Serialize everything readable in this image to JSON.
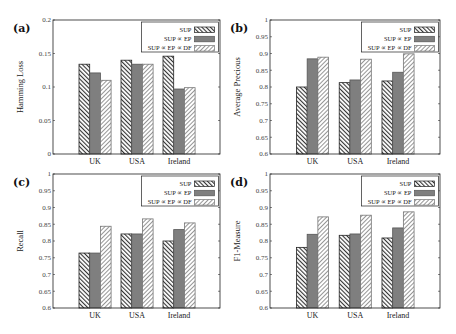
{
  "figure": {
    "legend": [
      {
        "label": "SUP",
        "pattern": "hatch-back"
      },
      {
        "label": "SUP ∝ EP",
        "pattern": "solid-gray"
      },
      {
        "label": "SUP ∝ EP ∝ DF",
        "pattern": "hatch-forward"
      }
    ],
    "colors": {
      "solid": "#7f7f7f",
      "hatch_dark": "#333333",
      "hatch_light": "#8a8a8a",
      "frame": "#222222"
    }
  },
  "chart_data": [
    {
      "panel": "(a)",
      "type": "bar",
      "title": "",
      "xlabel": "",
      "ylabel": "Hamming Loss",
      "ylim": [
        0,
        0.2
      ],
      "yticks": [
        0,
        0.05,
        0.1,
        0.15,
        0.2
      ],
      "ytick_labels": [
        "0",
        "0.05",
        "0.1",
        "0.15",
        "0.2"
      ],
      "categories": [
        "UK",
        "USA",
        "Ireland"
      ],
      "series": [
        {
          "name": "SUP",
          "values": [
            0.134,
            0.14,
            0.146
          ]
        },
        {
          "name": "SUP ∝ EP",
          "values": [
            0.121,
            0.134,
            0.097
          ]
        },
        {
          "name": "SUP ∝ EP ∝ DF",
          "values": [
            0.11,
            0.134,
            0.099
          ]
        }
      ],
      "legend_position": "upper right",
      "grid": false
    },
    {
      "panel": "(b)",
      "type": "bar",
      "title": "",
      "xlabel": "",
      "ylabel": "Average Precious",
      "ylim": [
        0.6,
        1
      ],
      "yticks": [
        0.6,
        0.65,
        0.7,
        0.75,
        0.8,
        0.85,
        0.9,
        0.95,
        1
      ],
      "ytick_labels": [
        "0.6",
        "0.65",
        "0.7",
        "0.75",
        "0.8",
        "0.85",
        "0.9",
        "0.95",
        "1"
      ],
      "categories": [
        "UK",
        "USA",
        "Ireland"
      ],
      "series": [
        {
          "name": "SUP",
          "values": [
            0.8,
            0.813,
            0.818
          ]
        },
        {
          "name": "SUP ∝ EP",
          "values": [
            0.884,
            0.821,
            0.844
          ]
        },
        {
          "name": "SUP ∝ EP ∝ DF",
          "values": [
            0.889,
            0.883,
            0.899
          ]
        }
      ],
      "legend_position": "upper right",
      "grid": false
    },
    {
      "panel": "(c)",
      "type": "bar",
      "title": "",
      "xlabel": "",
      "ylabel": "Recall",
      "ylim": [
        0.6,
        1
      ],
      "yticks": [
        0.6,
        0.65,
        0.7,
        0.75,
        0.8,
        0.85,
        0.9,
        0.95,
        1
      ],
      "ytick_labels": [
        "0.6",
        "0.65",
        "0.7",
        "0.75",
        "0.8",
        "0.85",
        "0.9",
        "0.95",
        "1"
      ],
      "categories": [
        "UK",
        "USA",
        "Ireland"
      ],
      "series": [
        {
          "name": "SUP",
          "values": [
            0.764,
            0.821,
            0.8
          ]
        },
        {
          "name": "SUP ∝ EP",
          "values": [
            0.764,
            0.821,
            0.834
          ]
        },
        {
          "name": "SUP ∝ EP ∝ DF",
          "values": [
            0.844,
            0.866,
            0.854
          ]
        }
      ],
      "legend_position": "upper right",
      "grid": false
    },
    {
      "panel": "(d)",
      "type": "bar",
      "title": "",
      "xlabel": "",
      "ylabel": "F1-Measure",
      "ylim": [
        0.6,
        1
      ],
      "yticks": [
        0.6,
        0.65,
        0.7,
        0.75,
        0.8,
        0.85,
        0.9,
        0.95,
        1
      ],
      "ytick_labels": [
        "0.6",
        "0.65",
        "0.7",
        "0.75",
        "0.8",
        "0.85",
        "0.9",
        "0.95",
        "1"
      ],
      "categories": [
        "UK",
        "USA",
        "Ireland"
      ],
      "series": [
        {
          "name": "SUP",
          "values": [
            0.781,
            0.817,
            0.809
          ]
        },
        {
          "name": "SUP ∝ EP",
          "values": [
            0.82,
            0.821,
            0.839
          ]
        },
        {
          "name": "SUP ∝ EP ∝ DF",
          "values": [
            0.872,
            0.877,
            0.887
          ]
        }
      ],
      "legend_position": "upper right",
      "grid": false
    }
  ]
}
